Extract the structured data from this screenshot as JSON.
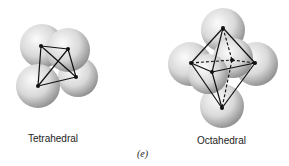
{
  "figure": {
    "caption": "(e)",
    "panels": [
      {
        "id": "tetrahedral",
        "label": "Tetrahedral",
        "sphere_count": 4,
        "shape": "tetrahedron"
      },
      {
        "id": "octahedral",
        "label": "Octahedral",
        "sphere_count": 6,
        "shape": "octahedron"
      }
    ],
    "colors": {
      "sphere_light": "#f4f4f4",
      "sphere_dark": "#8a8a8a",
      "edge": "#111111"
    }
  }
}
